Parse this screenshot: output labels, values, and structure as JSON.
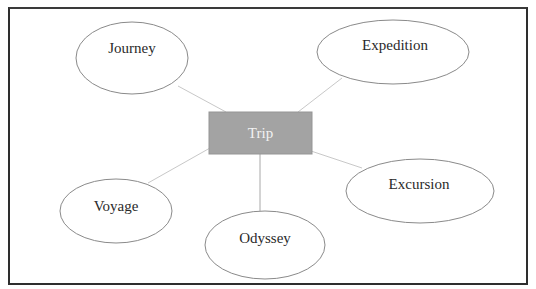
{
  "diagram": {
    "type": "mind-map",
    "center": {
      "label": "Trip",
      "fill": "#a3a3a3",
      "text_color": "#f2f2f2"
    },
    "nodes": [
      {
        "id": "journey",
        "label": "Journey"
      },
      {
        "id": "expedition",
        "label": "Expedition"
      },
      {
        "id": "voyage",
        "label": "Voyage"
      },
      {
        "id": "odyssey",
        "label": "Odyssey"
      },
      {
        "id": "excursion",
        "label": "Excursion"
      }
    ],
    "edges": [
      {
        "from": "Trip",
        "to": "Journey"
      },
      {
        "from": "Trip",
        "to": "Expedition"
      },
      {
        "from": "Trip",
        "to": "Voyage"
      },
      {
        "from": "Trip",
        "to": "Odyssey"
      },
      {
        "from": "Trip",
        "to": "Excursion"
      }
    ],
    "colors": {
      "border": "#2e2e2e",
      "ellipse_stroke": "#8a8a8a",
      "connector": "#c8c8c8"
    }
  }
}
